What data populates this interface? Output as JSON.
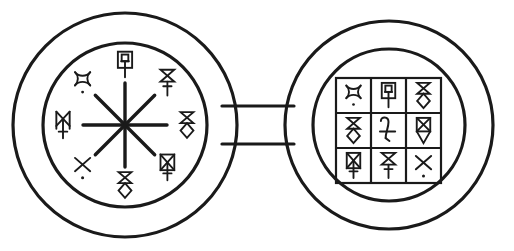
{
  "figure": {
    "background_color": "#ffffff",
    "stroke_color": "#1a1a1a",
    "ring_stroke_width": 3.2,
    "symbol_stroke_width": 2.0,
    "connector": {
      "name": "connector-bar",
      "x": 222,
      "y": 106,
      "width": 72,
      "height": 38
    },
    "left_disc": {
      "label": "Left disc — eight-spoke star wheel",
      "center_x": 125,
      "center_y": 125,
      "outer_radius": 112,
      "inner_radius": 82,
      "star": {
        "name": "eight-point-asterisk",
        "rays": 8,
        "ray_length": 42
      },
      "symbols": [
        {
          "slot": "top",
          "name": "box-square-stem",
          "angle_deg": 270,
          "radius": 60,
          "glyph_id": "boxSquareStem"
        },
        {
          "slot": "top-right",
          "name": "hourglass-stem",
          "angle_deg": 315,
          "radius": 60,
          "glyph_id": "hourglassStem"
        },
        {
          "slot": "right",
          "name": "hourglass-diamond",
          "angle_deg": 0,
          "radius": 62,
          "glyph_id": "hourglassDiamond"
        },
        {
          "slot": "bottom-right",
          "name": "boxed-x-stem",
          "angle_deg": 45,
          "radius": 60,
          "glyph_id": "boxedXStem"
        },
        {
          "slot": "bottom",
          "name": "hourglass-diamond",
          "angle_deg": 90,
          "radius": 60,
          "glyph_id": "hourglassDiamond"
        },
        {
          "slot": "bottom-left",
          "name": "x-with-dot",
          "angle_deg": 135,
          "radius": 60,
          "glyph_id": "xWithDot"
        },
        {
          "slot": "left",
          "name": "double-bar-x-stem",
          "angle_deg": 180,
          "radius": 62,
          "glyph_id": "doubleBarXStem"
        },
        {
          "slot": "top-left",
          "name": "curved-x-with-dot",
          "angle_deg": 225,
          "radius": 60,
          "glyph_id": "curvedXDot"
        }
      ]
    },
    "right_disc": {
      "label": "Right disc — three by three sigil grid",
      "center_x": 389,
      "center_y": 125,
      "outer_radius": 104,
      "inner_radius": 76,
      "grid": {
        "name": "sigil-grid",
        "rows": 3,
        "cols": 3,
        "x": 336,
        "y": 78,
        "cell_size": 35,
        "cells": [
          {
            "row": 0,
            "col": 0,
            "name": "curved-x-with-dot",
            "glyph_id": "curvedXDot"
          },
          {
            "row": 0,
            "col": 1,
            "name": "box-square-stem",
            "glyph_id": "boxSquareStem"
          },
          {
            "row": 0,
            "col": 2,
            "name": "hourglass-diamond",
            "glyph_id": "hourglassDiamond"
          },
          {
            "row": 1,
            "col": 0,
            "name": "hourglass-diamond",
            "glyph_id": "hourglassDiamond"
          },
          {
            "row": 1,
            "col": 1,
            "name": "jupiter-symbol",
            "glyph_id": "jupiter"
          },
          {
            "row": 1,
            "col": 2,
            "name": "boxed-hourglass-diamond",
            "glyph_id": "boxedHourglassDiamond"
          },
          {
            "row": 2,
            "col": 0,
            "name": "boxed-x-stem",
            "glyph_id": "boxedXStem"
          },
          {
            "row": 2,
            "col": 1,
            "name": "hourglass-stem",
            "glyph_id": "hourglassStem"
          },
          {
            "row": 2,
            "col": 2,
            "name": "x-with-dot",
            "glyph_id": "xWithDot"
          }
        ]
      }
    }
  }
}
